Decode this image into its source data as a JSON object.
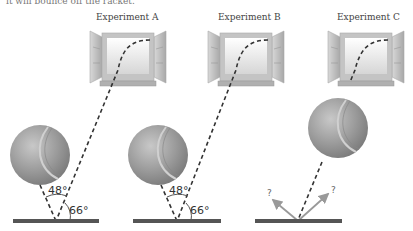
{
  "caption": "it will bounce off the racket.",
  "experiments": [
    {
      "label": "Experiment A",
      "incoming_angle": "48°",
      "ground_angle": "66°"
    },
    {
      "label": "Experiment B",
      "incoming_angle": "48°",
      "ground_angle": "66°"
    },
    {
      "label": "Experiment C",
      "unknown_left": "?",
      "unknown_right": "?"
    }
  ],
  "colors": {
    "ground": "#555555",
    "dash": "#333333",
    "arrow": "#999999",
    "ball": "#9a9a9a",
    "window_frame": "#bdbdbd"
  }
}
